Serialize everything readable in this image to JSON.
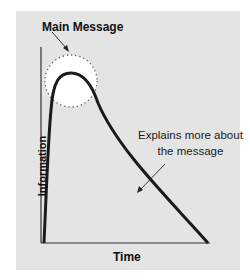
{
  "diagram": {
    "title_annotation": "Main Message",
    "body_annotation_line1": "Explains more about",
    "body_annotation_line2": "the message",
    "x_axis_label": "Time",
    "y_axis_label": "Information",
    "colors": {
      "panel_background": "#e4e4e4",
      "curve": "#1a1a1a",
      "highlight_circle": "#ffffff"
    },
    "shapes": [
      "curve-rapid-rise-then-gradual-decline",
      "dotted-circle-highlighting-peak",
      "arrow-from-main-message-to-circle",
      "arrow-from-explanation-to-descending-curve"
    ]
  }
}
